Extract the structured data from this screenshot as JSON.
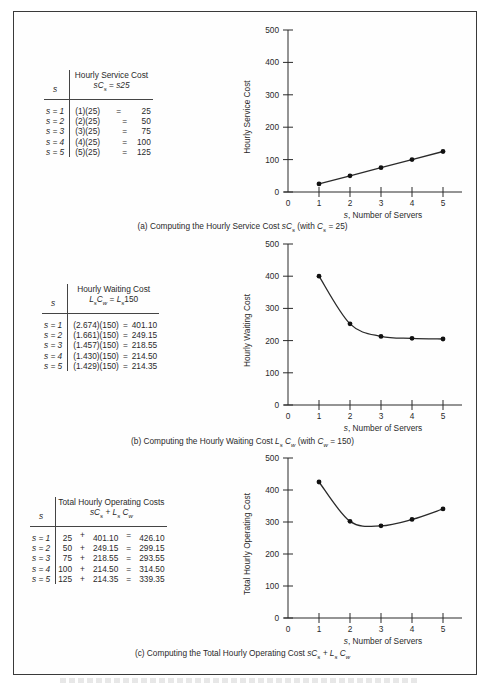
{
  "panels": {
    "a": {
      "caption_prefix": "(a)  Computing the Hourly Service Cost ",
      "caption_formula": "sC",
      "caption_sub": "s",
      "caption_suffix_1": " (with ",
      "caption_suffix_var": "C",
      "caption_suffix_sub": "s",
      "caption_suffix_2": " = 25)",
      "table": {
        "col_s": "s",
        "title": "Hourly Service Cost",
        "formula": "sCs = s25",
        "formula_parts": {
          "lhs": "sC",
          "lhs_sub": "s",
          "eq": " = ",
          "rhs": "s25"
        },
        "rows": [
          {
            "s": "s = 1",
            "calc": "(1)(25)",
            "eq": "=",
            "value": "25"
          },
          {
            "s": "s = 2",
            "calc": "(2)(25)",
            "eq": "=",
            "value": "50"
          },
          {
            "s": "s = 3",
            "calc": "(3)(25)",
            "eq": "=",
            "value": "75"
          },
          {
            "s": "s = 4",
            "calc": "(4)(25)",
            "eq": "=",
            "value": "100"
          },
          {
            "s": "s = 5",
            "calc": "(5)(25)",
            "eq": "=",
            "value": "125"
          }
        ]
      }
    },
    "b": {
      "caption_prefix": "(b)  Computing the Hourly Waiting Cost ",
      "caption_formula": "L",
      "caption_sub": "s",
      "caption_mid": " C",
      "caption_mid_sub": "w",
      "caption_suffix_1": "  (with ",
      "caption_suffix_var": "C",
      "caption_suffix_sub": "w",
      "caption_suffix_2": " = 150)",
      "table": {
        "col_s": "s",
        "title": "Hourly Waiting Cost",
        "formula": "LsCw = Ls150",
        "formula_parts": {
          "lhs": "L",
          "lhs_sub": "s",
          "lhs2": "C",
          "lhs2_sub": "w",
          "eq": " = ",
          "rhs": "L",
          "rhs_sub": "s",
          "rhs_tail": "150"
        },
        "rows": [
          {
            "s": "s = 1",
            "calc": "(2.674)(150)",
            "eq": "=",
            "value": "401.10"
          },
          {
            "s": "s = 2",
            "calc": "(1.661)(150)",
            "eq": "=",
            "value": "249.15"
          },
          {
            "s": "s = 3",
            "calc": "(1.457)(150)",
            "eq": "=",
            "value": "218.55"
          },
          {
            "s": "s = 4",
            "calc": "(1.430)(150)",
            "eq": "=",
            "value": "214.50"
          },
          {
            "s": "s = 5",
            "calc": "(1.429)(150)",
            "eq": "=",
            "value": "214.35"
          }
        ]
      }
    },
    "c": {
      "caption_prefix": "(c)  Computing the Total Hourly Operating Cost ",
      "caption_formula": "sC",
      "caption_sub": "s",
      "caption_mid": " + L",
      "caption_mid_sub": "s",
      "caption_tail": " C",
      "caption_tail_sub": "w",
      "table": {
        "col_s": "s",
        "title": "Total Hourly Operating Costs",
        "formula": "sCs + Ls Cw",
        "formula_parts": {
          "a": "sC",
          "a_sub": "s",
          "plus": " + ",
          "b": "L",
          "b_sub": "s",
          "c": " C",
          "c_sub": "w"
        },
        "rows": [
          {
            "s": "s = 1",
            "service": "25",
            "plus": "+",
            "waiting": "401.10",
            "eq": "=",
            "total": "426.10"
          },
          {
            "s": "s = 2",
            "service": "50",
            "plus": "+",
            "waiting": "249.15",
            "eq": "=",
            "total": "299.15"
          },
          {
            "s": "s = 3",
            "service": "75",
            "plus": "+",
            "waiting": "218.55",
            "eq": "=",
            "total": "293.55"
          },
          {
            "s": "s = 4",
            "service": "100",
            "plus": "+",
            "waiting": "214.50",
            "eq": "=",
            "total": "314.50"
          },
          {
            "s": "s = 5",
            "service": "125",
            "plus": "+",
            "waiting": "214.35",
            "eq": "=",
            "total": "339.35"
          }
        ]
      }
    }
  },
  "chart_data": [
    {
      "type": "line",
      "title": "(a) Computing the Hourly Service Cost sCs (with Cs = 25)",
      "xlabel": "s, Number of Servers",
      "ylabel": "Hourly Service Cost",
      "x": [
        1,
        2,
        3,
        4,
        5
      ],
      "values": [
        25,
        50,
        75,
        100,
        125
      ],
      "x_ticks": [
        0,
        1,
        2,
        3,
        4,
        5
      ],
      "y_ticks": [
        0,
        100,
        200,
        300,
        400,
        500
      ],
      "xlim": [
        0,
        5.5
      ],
      "ylim": [
        0,
        500
      ],
      "grid": false,
      "markers": true,
      "line_style": "straight"
    },
    {
      "type": "line",
      "title": "(b) Computing the Hourly Waiting Cost Ls Cw (with Cw = 150)",
      "xlabel": "s, Number of Servers",
      "ylabel": "Hourly Waiting Cost",
      "x": [
        1,
        2,
        3,
        4,
        5
      ],
      "values": [
        401.1,
        249.15,
        218.55,
        214.5,
        214.35
      ],
      "plotted_points_approx": [
        400,
        252,
        213,
        207,
        205
      ],
      "x_ticks": [
        0,
        1,
        2,
        3,
        4,
        5
      ],
      "y_ticks": [
        0,
        100,
        200,
        300,
        400,
        500
      ],
      "xlim": [
        0,
        5.5
      ],
      "ylim": [
        0,
        500
      ],
      "grid": false,
      "markers": true,
      "line_style": "smooth curve"
    },
    {
      "type": "line",
      "title": "(c) Computing the Total Hourly Operating Cost sCs + Ls Cw",
      "xlabel": "s, Number of Servers",
      "ylabel": "Total Hourly Operating Cost",
      "x": [
        1,
        2,
        3,
        4,
        5
      ],
      "values": [
        426.1,
        299.15,
        293.55,
        314.5,
        339.35
      ],
      "plotted_points_approx": [
        425,
        302,
        288,
        308,
        341
      ],
      "x_ticks": [
        0,
        1,
        2,
        3,
        4,
        5
      ],
      "y_ticks": [
        0,
        100,
        200,
        300,
        400,
        500
      ],
      "xlim": [
        0,
        5.5
      ],
      "ylim": [
        0,
        500
      ],
      "grid": false,
      "markers": true,
      "line_style": "smooth curve"
    }
  ],
  "axis_text": {
    "y_ticks": [
      "0",
      "100",
      "200",
      "300",
      "400",
      "500"
    ],
    "x_ticks": [
      "0",
      "1",
      "2",
      "3",
      "4",
      "5"
    ],
    "xlabel_var": "s",
    "xlabel_rest": ", Number of Servers",
    "ylabel_a": "Hourly Service Cost",
    "ylabel_b": "Hourly Waiting Cost",
    "ylabel_c": "Total Hourly Operating Cost"
  },
  "colors": {
    "ink": "#2a2a2a",
    "border": "#3a3a3a",
    "background": "#ffffff"
  }
}
